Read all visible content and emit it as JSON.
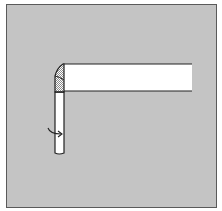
{
  "diagram": {
    "type": "paper-folding-step",
    "colors": {
      "background": "#c4c4c4",
      "paper": "#ffffff",
      "outline": "#222222",
      "hatch": "#9a9a9a",
      "frame_border": "#5a5a5a"
    },
    "elements": {
      "horizontal_strip": "horizontal paper strip extending right",
      "vertical_strip": "vertical paper strip extending down",
      "fold_corner": "hatched triangular fold at the corner",
      "rotation_arrow": "curved arrow indicating turning the strip over"
    }
  }
}
